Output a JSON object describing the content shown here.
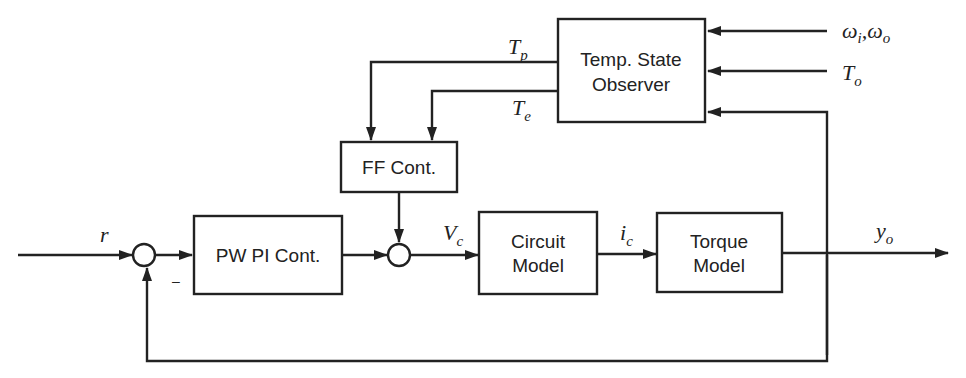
{
  "blocks": {
    "observer": {
      "line1": "Temp. State",
      "line2": "Observer"
    },
    "ff": {
      "label": "FF Cont."
    },
    "pi": {
      "label": "PW PI Cont."
    },
    "circuit": {
      "line1": "Circuit",
      "line2": "Model"
    },
    "torque": {
      "line1": "Torque",
      "line2": "Model"
    }
  },
  "signals": {
    "r": "r",
    "minus": "–",
    "vc": {
      "base": "V",
      "sub": "c"
    },
    "ic": {
      "base": "i",
      "sub": "c"
    },
    "yo": {
      "base": "y",
      "sub": "o"
    },
    "tp": {
      "base": "T",
      "sub": "p"
    },
    "te": {
      "base": "T",
      "sub": "e"
    },
    "to": {
      "base": "T",
      "sub": "o"
    },
    "omega": {
      "a": "ω",
      "a_sub": "i",
      "sep": ",",
      "b": "ω",
      "b_sub": "o"
    }
  }
}
